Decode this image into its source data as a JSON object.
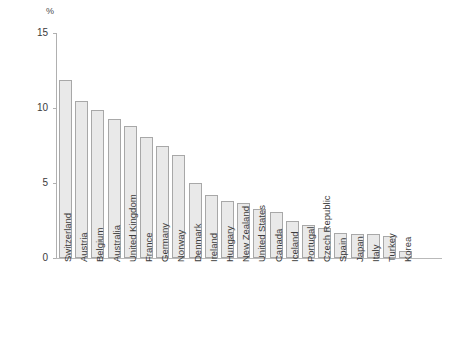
{
  "chart_data": {
    "type": "bar",
    "title": "",
    "subtitle": "",
    "xlabel": "",
    "ylabel": "%",
    "ylim": [
      0,
      15
    ],
    "yticks": [
      0,
      5,
      10,
      15
    ],
    "grid": false,
    "legend": "none",
    "bar_color": "#e9e9e9",
    "bar_border_color": "#a8a8a8",
    "axis_color": "#b0b0b0",
    "text_color": "#3b3b3b",
    "categories": [
      "Switzerland",
      "Austria",
      "Belgium",
      "Australia",
      "United Kingdom",
      "France",
      "Germany",
      "Norway",
      "Denmark",
      "Ireland",
      "Hungary",
      "New Zealand",
      "United States",
      "Canada",
      "Iceland",
      "Portugal",
      "Czech Republic",
      "Spain",
      "Japan",
      "Italy",
      "Turkey",
      "Korea"
    ],
    "values": [
      11.9,
      10.5,
      9.9,
      9.3,
      8.8,
      8.1,
      7.5,
      6.9,
      5.0,
      4.2,
      3.8,
      3.7,
      3.3,
      3.1,
      2.5,
      2.2,
      2.0,
      1.7,
      1.6,
      1.6,
      1.5,
      0.5
    ]
  }
}
